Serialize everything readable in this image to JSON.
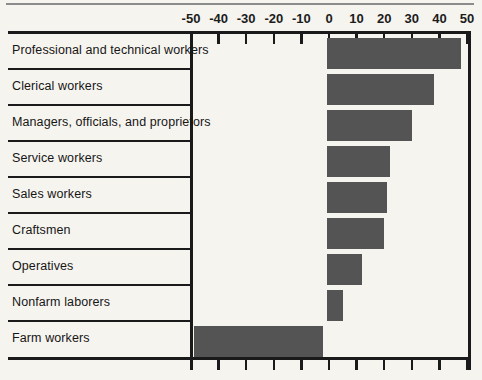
{
  "chart_data": {
    "type": "bar",
    "orientation": "horizontal",
    "title": "",
    "xlabel": "",
    "ylabel": "",
    "categories": [
      "Professional and technical workers",
      "Clerical workers",
      "Managers, officials, and proprietors",
      "Service workers",
      "Sales workers",
      "Craftsmen",
      "Operatives",
      "Nonfarm laborers",
      "Farm workers"
    ],
    "values": [
      48,
      38,
      30,
      22,
      21,
      20,
      12,
      5,
      -49
    ],
    "x_ticks": [
      "-50",
      "-40",
      "-30",
      "-20",
      "-10",
      "0",
      "10",
      "20",
      "30",
      "40",
      "50"
    ],
    "x_tick_values": [
      -50,
      -40,
      -30,
      -20,
      -10,
      0,
      10,
      20,
      30,
      40,
      50
    ],
    "xlim": [
      -50,
      50
    ],
    "grid": false,
    "legend": false,
    "bar_color": "#545454",
    "axis_color": "#1a1a1a",
    "background_color": "#f6f4ef",
    "top_rule_color": "#8c8c8c"
  }
}
